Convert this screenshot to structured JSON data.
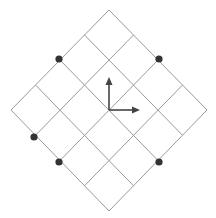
{
  "diagram": {
    "type": "rotated-grid",
    "grid": {
      "cells": 4,
      "rotation_deg": 45,
      "vertices": {
        "top": [
          109,
          10
        ],
        "right": [
          207,
          110
        ],
        "bottom": [
          109,
          211
        ],
        "left": [
          11,
          110
        ]
      },
      "line_color": "#9a9a9a"
    },
    "axes": {
      "origin": [
        109,
        110
      ],
      "x_tip": [
        140,
        110
      ],
      "y_tip": [
        109,
        77
      ],
      "color": "#444444"
    },
    "dots": [
      {
        "x": 59,
        "y": 59
      },
      {
        "x": 159,
        "y": 59
      },
      {
        "x": 34,
        "y": 137
      },
      {
        "x": 59,
        "y": 162
      },
      {
        "x": 159,
        "y": 162
      }
    ],
    "dot_color": "#333333",
    "dot_radius": 3.6
  }
}
